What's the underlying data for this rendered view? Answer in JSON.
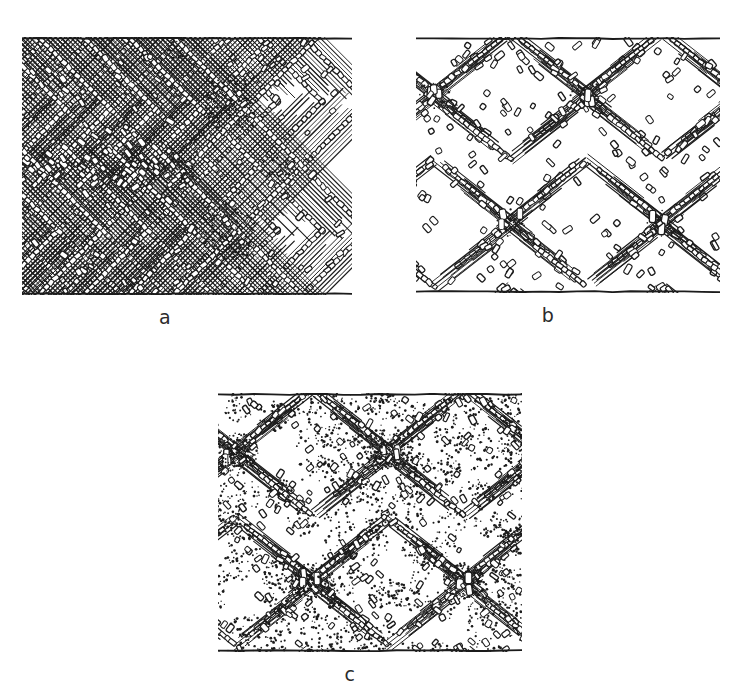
{
  "figure": {
    "background_color": "#ffffff",
    "ink_color": "#1b1b1b",
    "panel_count": 3
  },
  "panels": [
    {
      "id": "a",
      "label": "a",
      "pattern_name": "chevron",
      "frame": {
        "x": 22,
        "y": 37,
        "width": 330,
        "height": 258
      },
      "label_pos": {
        "x": 165,
        "y": 307
      },
      "boundary_lines": [
        "top",
        "bottom"
      ],
      "texture": {
        "hatch_band_spacing": 15,
        "hatch_line_gap": 3.4,
        "rod_end_rect_w": 4.2,
        "rod_end_rect_h": 7.0,
        "stipple_density": 0.28,
        "chevron_apex_x": 150,
        "chevron_periods": 4
      }
    },
    {
      "id": "b",
      "label": "b",
      "pattern_name": "diamond-lattice",
      "frame": {
        "x": 416,
        "y": 37,
        "width": 304,
        "height": 256
      },
      "label_pos": {
        "x": 548,
        "y": 305
      },
      "boundary_lines": [
        "top",
        "bottom"
      ],
      "texture": {
        "hatch_band_spacing": 14,
        "hatch_line_gap": 3.6,
        "rod_end_rect_w": 4.6,
        "rod_end_rect_h": 8.0,
        "stipple_density": 0.22,
        "cell_w": 152,
        "cell_h": 128
      }
    },
    {
      "id": "c",
      "label": "c",
      "pattern_name": "diamond-lattice-dense-stipple",
      "frame": {
        "x": 218,
        "y": 393,
        "width": 304,
        "height": 259
      },
      "label_pos": {
        "x": 350,
        "y": 664
      },
      "boundary_lines": [
        "top",
        "bottom"
      ],
      "texture": {
        "hatch_band_spacing": 15,
        "hatch_line_gap": 3.6,
        "rod_end_rect_w": 4.4,
        "rod_end_rect_h": 7.4,
        "stipple_density": 0.62,
        "cell_w": 152,
        "cell_h": 130
      }
    }
  ],
  "chart_data": {
    "type": "diagram",
    "panels": [
      "a",
      "b",
      "c"
    ],
    "legend": [],
    "annotations": [
      "a",
      "b",
      "c"
    ]
  }
}
